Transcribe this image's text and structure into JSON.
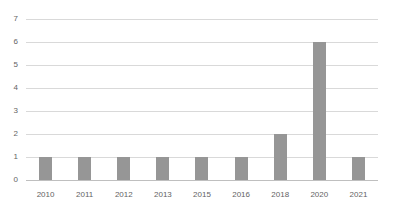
{
  "chart_data": {
    "type": "bar",
    "title": "",
    "subtitle": "",
    "xlabel": "",
    "ylabel": "",
    "categories": [
      "2010",
      "2011",
      "2012",
      "2013",
      "2015",
      "2016",
      "2018",
      "2020",
      "2021"
    ],
    "values": [
      1,
      1,
      1,
      1,
      1,
      1,
      2,
      6,
      1
    ],
    "ylim": [
      0,
      7
    ],
    "y_ticks": [
      "0",
      "1",
      "2",
      "3",
      "4",
      "5",
      "6",
      "7"
    ],
    "y_tick_values": [
      0,
      1,
      2,
      3,
      4,
      5,
      6,
      7
    ],
    "grid": true,
    "legend": false,
    "legend_position": "none",
    "colors": {
      "bar": "#969696",
      "gridline": "#d9d9d9",
      "baseline": "#bfbfbf",
      "tick_label": "#636363",
      "background": "#ffffff"
    }
  }
}
